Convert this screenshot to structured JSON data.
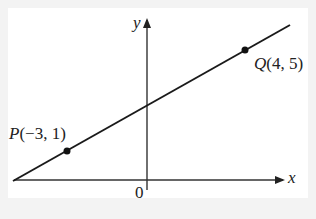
{
  "diagram": {
    "axes": {
      "x_label": "x",
      "y_label": "y",
      "origin_label": "0"
    },
    "points": [
      {
        "name": "P",
        "label": "P(−3, 1)",
        "x": -3,
        "y": 1
      },
      {
        "name": "Q",
        "label": "Q(4, 5)",
        "x": 4,
        "y": 5
      }
    ],
    "labels": {
      "p_name": "P",
      "p_coords": "(−3, 1)",
      "q_name": "Q",
      "q_coords": "(4, 5)"
    },
    "line_color": "#1a1a1a"
  }
}
